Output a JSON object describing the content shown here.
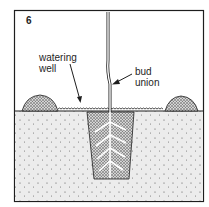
{
  "figure": {
    "step_number": "6",
    "labels": {
      "watering_well_line1": "watering",
      "watering_well_line2": "well",
      "bud_union_line1": "bud",
      "bud_union_line2": "union"
    },
    "colors": {
      "ink": "#1e1e1e",
      "soil_fill": "#ebebeb",
      "background": "#ffffff"
    }
  }
}
